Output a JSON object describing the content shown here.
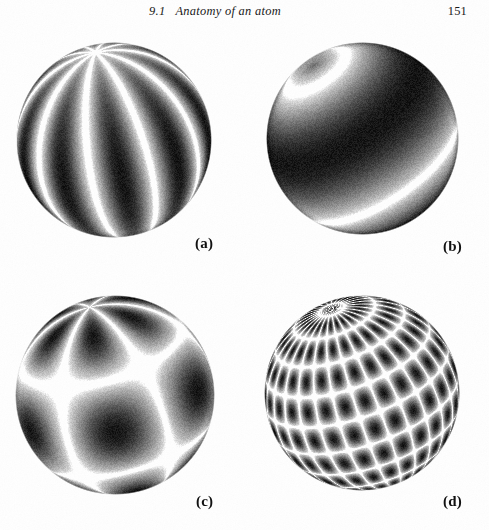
{
  "page": {
    "background_color": "#ffffff",
    "ink_color": "#111111",
    "width": 489,
    "height": 530
  },
  "running_head": {
    "section_number": "9.1",
    "title": "9.1   Anatomy of an atom",
    "page_number": "151"
  },
  "figure": {
    "kind": "spherical-harmonic-plates",
    "panel_count": 4,
    "panels": [
      {
        "id": "a",
        "caption": "(a)",
        "description": "sectoral spherical harmonic with vertical lobes",
        "pattern": "sectoral",
        "center_x": 114,
        "center_y": 140,
        "diameter": 196,
        "lobes_longitude": 5,
        "lobes_latitude": 1,
        "tilt_degrees": -12,
        "caption_x": 195,
        "caption_y": 236
      },
      {
        "id": "b",
        "caption": "(b)",
        "description": "zonal spherical harmonic with dark polar cap and one bright nodal ring",
        "pattern": "zonal",
        "center_x": 362,
        "center_y": 138,
        "diameter": 193,
        "lobes_longitude": 1,
        "lobes_latitude": 2,
        "tilt_degrees": -34,
        "caption_x": 443,
        "caption_y": 239
      },
      {
        "id": "c",
        "caption": "(c)",
        "description": "tesseral spherical harmonic with large dark lobes and bright curved nodal lines",
        "pattern": "tesseral-coarse",
        "center_x": 115,
        "center_y": 395,
        "diameter": 200,
        "lobes_longitude": 3,
        "lobes_latitude": 3,
        "tilt_degrees": -16,
        "caption_x": 196,
        "caption_y": 494
      },
      {
        "id": "d",
        "caption": "(d)",
        "description": "high-order tesseral spherical harmonic forming a dense checkerboard grid",
        "pattern": "tesseral-fine",
        "center_x": 362,
        "center_y": 393,
        "diameter": 196,
        "lobes_longitude": 14,
        "lobes_latitude": 10,
        "tilt_degrees": -20,
        "caption_x": 443,
        "caption_y": 494
      }
    ]
  }
}
